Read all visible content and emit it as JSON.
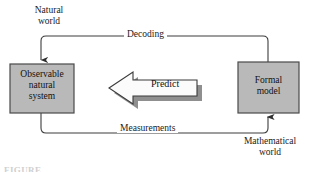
{
  "diagram": {
    "background_color": "#ffffff",
    "line_color": "#3c3c3c",
    "box_fill_color": "#b9b9b9",
    "box_border_color": "#4a4a4a",
    "arrow_fill_color": "#fbfbfb",
    "arrow_shadow_color": "#8f8f8f",
    "text_color": "#1a1a1a"
  },
  "labels": {
    "natural_world": {
      "line1": "Natural",
      "line2": "world"
    },
    "mathematical_world": {
      "line1": "Mathematical",
      "line2": "world"
    }
  },
  "nodes": {
    "observable_system": {
      "line1": "Observable",
      "line2": "natural",
      "line3": "system"
    },
    "formal_model": {
      "line1": "Formal",
      "line2": "model"
    }
  },
  "edges": {
    "decoding": {
      "label": "Decoding",
      "from": "formal_model",
      "to": "observable_system",
      "direction": "right-to-left"
    },
    "measurements": {
      "label": "Measurements",
      "from": "observable_system",
      "to": "formal_model",
      "direction": "left-to-right"
    },
    "predict": {
      "label": "Predict",
      "from": "formal_model",
      "to": "observable_system",
      "direction": "right-to-left"
    }
  },
  "caption": {
    "text": "FIGURE"
  }
}
